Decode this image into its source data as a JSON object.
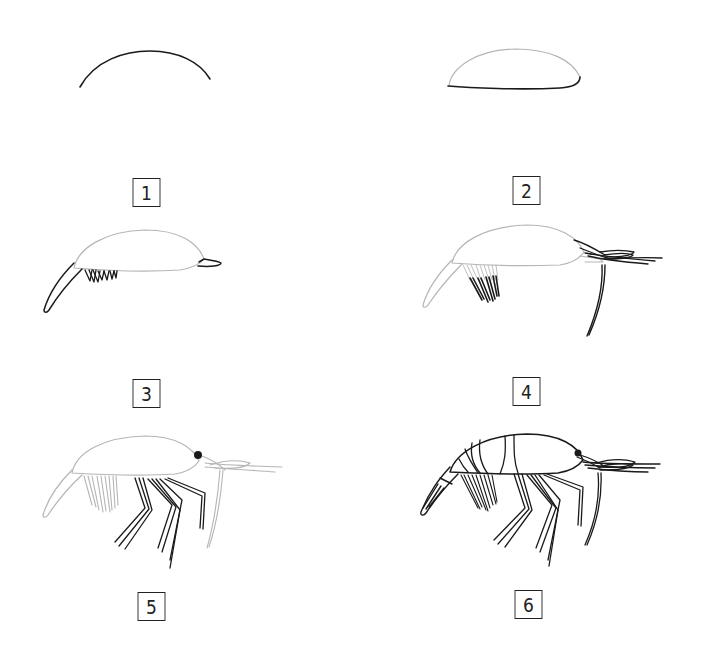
{
  "colors": {
    "background": "#ffffff",
    "ink": "#1a1a1a",
    "guide": "#b5b5b5"
  },
  "steps": [
    {
      "number": "1",
      "description": "Draw the curved arc of the back"
    },
    {
      "number": "2",
      "description": "Close the body shape with the belly line"
    },
    {
      "number": "3",
      "description": "Add the tail and swimmerets and the rostrum"
    },
    {
      "number": "4",
      "description": "Add the antennae and long whisker"
    },
    {
      "number": "5",
      "description": "Add the eye and the walking legs"
    },
    {
      "number": "6",
      "description": "Add body segments and finish the details"
    }
  ]
}
